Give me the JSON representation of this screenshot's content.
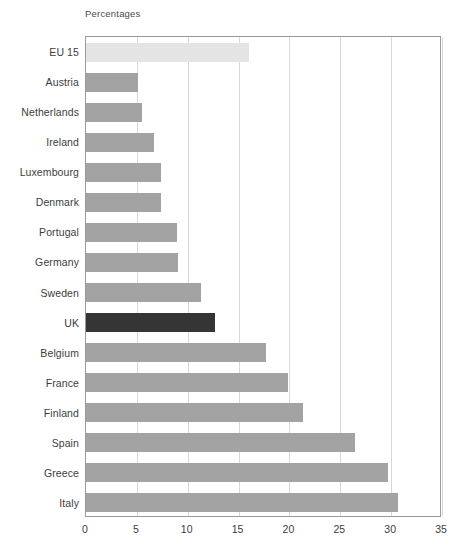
{
  "chart_data": {
    "type": "bar",
    "orientation": "horizontal",
    "title": "",
    "axis_title": "Percentages",
    "xlabel": "",
    "ylabel": "",
    "xlim": [
      0,
      35
    ],
    "xticks": [
      0,
      5,
      10,
      15,
      20,
      25,
      30,
      35
    ],
    "xtick_labels": [
      "0",
      "5",
      "10",
      "15",
      "20",
      "25",
      "30",
      "35"
    ],
    "grid": true,
    "legend": "none",
    "categories": [
      "EU 15",
      "Austria",
      "Netherlands",
      "Ireland",
      "Luxembourg",
      "Denmark",
      "Portugal",
      "Germany",
      "Sweden",
      "UK",
      "Belgium",
      "France",
      "Finland",
      "Spain",
      "Greece",
      "Italy"
    ],
    "values": [
      16.0,
      5.1,
      5.5,
      6.7,
      7.4,
      7.4,
      8.9,
      9.0,
      11.3,
      12.7,
      17.7,
      19.9,
      21.3,
      26.4,
      29.7,
      30.7
    ],
    "bar_colors": [
      "#e4e4e4",
      "#a3a3a3",
      "#a3a3a3",
      "#a3a3a3",
      "#a3a3a3",
      "#a3a3a3",
      "#a3a3a3",
      "#a3a3a3",
      "#a3a3a3",
      "#353535",
      "#a3a3a3",
      "#a3a3a3",
      "#a3a3a3",
      "#a3a3a3",
      "#a3a3a3",
      "#a3a3a3"
    ],
    "colors": {
      "default_bar": "#a3a3a3",
      "aggregate_bar": "#e4e4e4",
      "highlight_bar": "#353535",
      "gridline": "#d8d8d8",
      "frame": "#9a9a9a",
      "text": "#3d3d3d",
      "background": "#ffffff"
    }
  }
}
